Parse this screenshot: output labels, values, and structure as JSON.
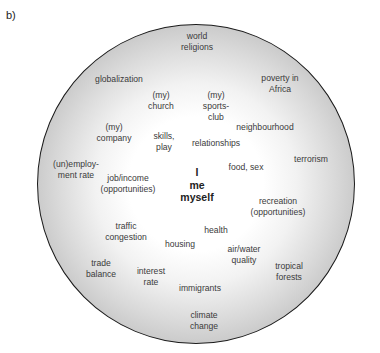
{
  "panel_label": "b)",
  "center": {
    "label": "I\nme\nmyself",
    "x": 197,
    "y": 166
  },
  "terms": [
    {
      "id": "world-religions",
      "label": "world\nreligions",
      "x": 197,
      "y": 31
    },
    {
      "id": "globalization",
      "label": "globalization",
      "x": 119,
      "y": 74
    },
    {
      "id": "poverty-in-africa",
      "label": "poverty in\nAfrica",
      "x": 280,
      "y": 73
    },
    {
      "id": "my-church",
      "label": "(my)\nchurch",
      "x": 161,
      "y": 90
    },
    {
      "id": "my-sports-club",
      "label": "(my)\nsports-\nclub",
      "x": 216,
      "y": 90
    },
    {
      "id": "neighbourhood",
      "label": "neighbourhood",
      "x": 265,
      "y": 122
    },
    {
      "id": "my-company",
      "label": "(my)\ncompany",
      "x": 114,
      "y": 122
    },
    {
      "id": "skills-play",
      "label": "skills,\nplay",
      "x": 164,
      "y": 131
    },
    {
      "id": "relationships",
      "label": "relationships",
      "x": 216,
      "y": 138
    },
    {
      "id": "terrorism",
      "label": "terrorism",
      "x": 311,
      "y": 154
    },
    {
      "id": "food-sex",
      "label": "food, sex",
      "x": 246,
      "y": 162
    },
    {
      "id": "unemployment-rate",
      "label": "(un)employ-\nment rate",
      "x": 76,
      "y": 159
    },
    {
      "id": "job-income",
      "label": "job/income\n(opportunities)",
      "x": 128,
      "y": 173
    },
    {
      "id": "recreation",
      "label": "recreation\n(opportunities)",
      "x": 278,
      "y": 196
    },
    {
      "id": "traffic-congestion",
      "label": "traffic\ncongestion",
      "x": 126,
      "y": 221
    },
    {
      "id": "health",
      "label": "health",
      "x": 216,
      "y": 225
    },
    {
      "id": "housing",
      "label": "housing",
      "x": 180,
      "y": 239
    },
    {
      "id": "air-water-quality",
      "label": "air/water\nquality",
      "x": 244,
      "y": 244
    },
    {
      "id": "trade-balance",
      "label": "trade\nbalance",
      "x": 101,
      "y": 258
    },
    {
      "id": "tropical-forests",
      "label": "tropical\nforests",
      "x": 289,
      "y": 261
    },
    {
      "id": "interest-rate",
      "label": "interest\nrate",
      "x": 151,
      "y": 266
    },
    {
      "id": "immigrants",
      "label": "immigrants",
      "x": 200,
      "y": 283
    },
    {
      "id": "climate-change",
      "label": "climate\nchange",
      "x": 204,
      "y": 310
    }
  ]
}
